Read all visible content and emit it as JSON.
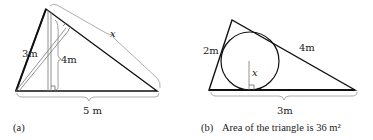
{
  "figure_a": {
    "caption_label": "(a)",
    "side_left": "3m",
    "altitude": "4m",
    "hypotenuse_var": "x",
    "base": "5 m"
  },
  "figure_b": {
    "caption_label": "(b)",
    "caption_text": "Area of the triangle is 36 m²",
    "side_left": "2m",
    "side_right": "4m",
    "radius_var": "x",
    "base": "3m"
  },
  "colors": {
    "stroke": "#111111",
    "brace": "#888888",
    "text": "#222222"
  }
}
